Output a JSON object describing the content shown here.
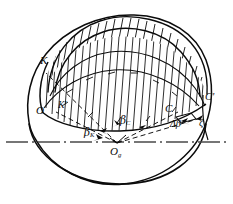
{
  "figure": {
    "stroke_color": "#0b0b0b",
    "axis_color": "#3a3a3a",
    "background": "#ffffff",
    "width": 233,
    "height": 204
  },
  "labels": {
    "point_k": "K",
    "point_k_prime": "K'",
    "point_o": "O",
    "point_c": "C",
    "point_c_prime": "C'",
    "center": "O",
    "center_sub": "g",
    "angle_beta_k": "β",
    "angle_beta_k_sub": "K",
    "angle_beta_c": "β",
    "angle_beta_c_sub": "C",
    "angle_delta_beta": "Δβ",
    "angle_zeta": "ζ"
  },
  "geometry": {
    "center": {
      "x": 117,
      "y": 143
    },
    "axis_line": {
      "x1": 6,
      "y1": 142,
      "x2": 228,
      "y2": 142,
      "style": "dash-dot"
    },
    "body_ellipse": {
      "cx": 117,
      "cy": 104,
      "rx": 88,
      "ry": 74
    },
    "dome_cap_note": "hatched spherical segment above chord O-C",
    "radial_lines": [
      {
        "from": "O_g",
        "to": "K",
        "style": "dashed"
      },
      {
        "from": "O_g",
        "to": "K'",
        "style": "dashed"
      },
      {
        "from": "O_g",
        "to": "C",
        "style": "dashed"
      },
      {
        "from": "O_g",
        "to": "C'",
        "style": "dashed"
      }
    ],
    "hatch": {
      "direction": "near-vertical",
      "count": 22,
      "color": "#0b0b0b"
    }
  }
}
